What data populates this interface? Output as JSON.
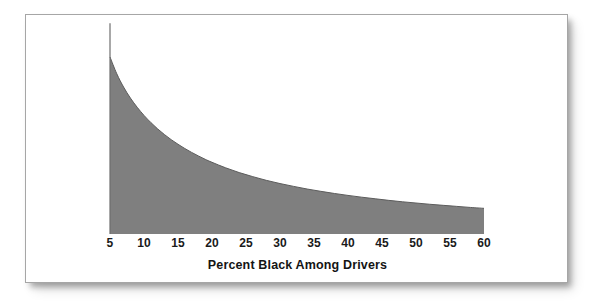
{
  "figure": {
    "frame_border_color": "#a6a6a6",
    "background_color": "#ffffff"
  },
  "chart_data": {
    "type": "area",
    "title": "",
    "subtitle": "",
    "xlabel": "Percent Black Among Drivers",
    "ylabel": "",
    "grid": false,
    "legend": "none",
    "fill_color": "#7f7f7f",
    "line_color": "#5c5c5c",
    "axis_line_color": "#6e6e6e",
    "xlim": [
      5,
      60
    ],
    "ylim": [
      0,
      1
    ],
    "xticks": [
      5,
      10,
      15,
      20,
      25,
      30,
      35,
      40,
      45,
      50,
      55,
      60
    ],
    "xtick_labels": [
      "5",
      "10",
      "15",
      "20",
      "25",
      "30",
      "35",
      "40",
      "45",
      "50",
      "55",
      "60"
    ],
    "yticks": [],
    "ytick_labels": [],
    "annotations": [],
    "series": [
      {
        "name": "Density of percent black among drivers",
        "x": [
          5,
          6,
          7,
          8,
          9,
          10,
          11,
          12,
          13,
          14,
          15,
          16,
          17,
          18,
          19,
          20,
          22,
          24,
          26,
          28,
          30,
          32,
          34,
          36,
          38,
          40,
          42,
          44,
          46,
          48,
          50,
          52,
          54,
          56,
          58,
          60
        ],
        "y": [
          1.0,
          0.905,
          0.83,
          0.768,
          0.716,
          0.67,
          0.63,
          0.594,
          0.562,
          0.533,
          0.507,
          0.483,
          0.461,
          0.441,
          0.422,
          0.405,
          0.374,
          0.347,
          0.324,
          0.303,
          0.285,
          0.269,
          0.254,
          0.241,
          0.229,
          0.218,
          0.208,
          0.199,
          0.19,
          0.182,
          0.175,
          0.168,
          0.162,
          0.156,
          0.15,
          0.145
        ]
      }
    ],
    "axis_vertical_line": {
      "x": 5,
      "y_from": 0,
      "y_to": 1.19
    }
  }
}
